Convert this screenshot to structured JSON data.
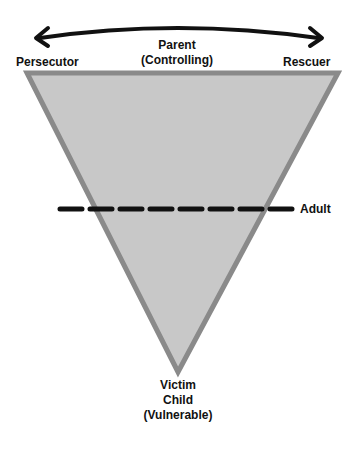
{
  "diagram": {
    "top_arrow": "bidirectional",
    "labels": {
      "parent_line1": "Parent",
      "parent_line2": "(Controlling)",
      "left_vertex": "Persecutor",
      "right_vertex": "Rescuer",
      "adult": "Adult",
      "bottom_line1": "Victim",
      "bottom_line2": "Child",
      "bottom_line3": "(Vulnerable)"
    },
    "colors": {
      "triangle_fill": "#c8c8c8",
      "triangle_stroke": "#8a8a8a",
      "line": "#111111"
    }
  }
}
